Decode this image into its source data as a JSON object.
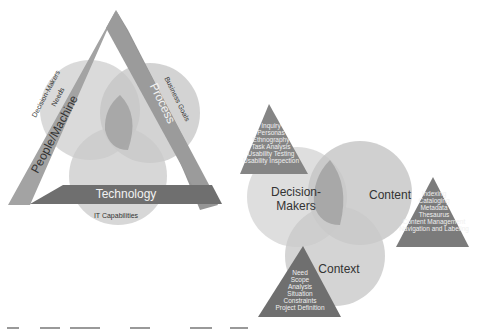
{
  "left_diagram": {
    "bars": {
      "people_machine": "People/Machine",
      "process": "Process",
      "technology": "Technology"
    },
    "circle_labels": {
      "decision_makers_needs_line1": "Decision-Makers",
      "decision_makers_needs_line2": "Needs",
      "business_goals": "Business Goals",
      "it_capabilities": "IT Capabilities"
    }
  },
  "right_diagram": {
    "circles": {
      "decision_makers_line1": "Decision-",
      "decision_makers_line2": "Makers",
      "content": "Content",
      "context": "Context"
    },
    "triangles": {
      "users": [
        "Inquiry",
        "Personas",
        "Ethnography",
        "Task Analysis",
        "Usability Testing",
        "Usability Inspection"
      ],
      "content": [
        "Indexing",
        "Cataloging",
        "Metadata",
        "Thesaurus",
        "Content Management",
        "Navigation and Labeling"
      ],
      "context": [
        "Need",
        "Scope",
        "Analysis",
        "Situation",
        "Constraints",
        "Project Definition"
      ]
    }
  },
  "colors": {
    "circle_light": "#d8d8d8",
    "circle_mid": "#bdbdbd",
    "overlap": "#a8a8a8",
    "center": "#8f8f8f",
    "bar": "#9a9a9a",
    "bar_dark": "#6c6c6c",
    "triangle": "#7d7d7d"
  }
}
